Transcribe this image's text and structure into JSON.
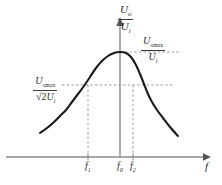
{
  "figure": {
    "kind": "resonance-bandwidth-curve",
    "background_color": "#ffffff",
    "curve_color": "#1a1a1a",
    "axis_color": "#8a8a8a",
    "dash_color": "#9a9a9a",
    "text_color": "#2b2b2b"
  },
  "axes": {
    "y_axis_label": {
      "numerator_symbol": "U",
      "numerator_sub": "o",
      "denominator_symbol": "U",
      "denominator_sub": "i",
      "text": "Uo/Ui"
    },
    "x_axis_label": "f",
    "x_ticks": [
      {
        "id": "f1",
        "symbol": "f",
        "sub": "1",
        "text": "f1",
        "x": 88
      },
      {
        "id": "f0",
        "symbol": "f",
        "sub": "0",
        "text": "f0",
        "x": 120
      },
      {
        "id": "f2",
        "symbol": "f",
        "sub": "2",
        "text": "f2",
        "x": 133
      }
    ]
  },
  "annotations": {
    "peak_level": {
      "numerator_symbol": "U",
      "numerator_sub": "omax",
      "denominator_symbol": "U",
      "denominator_sub": "i",
      "text": "Uomax/Ui"
    },
    "half_power_level": {
      "numerator_symbol": "U",
      "numerator_sub": "omax",
      "denominator_radical": "2",
      "denominator_symbol": "U",
      "denominator_sub": "i",
      "text": "Uomax/(sqrt2 Ui)"
    }
  },
  "chart_data": {
    "type": "line",
    "title": "",
    "xlabel": "f",
    "ylabel": "Uo/Ui",
    "grid": false,
    "legend": null,
    "xlim": [
      30,
      200
    ],
    "ylim": [
      0,
      1.05
    ],
    "markers": {
      "f0_x": 120,
      "f1_x": 88,
      "f2_x": 133,
      "peak_y_px": 52,
      "half_power_y_px": 85,
      "baseline_y_px": 157
    },
    "dashed_guides": [
      {
        "name": "peak-horizontal",
        "x1": 120,
        "y1": 52,
        "x2": 178,
        "y2": 52
      },
      {
        "name": "half-power-horizontal",
        "x1": 62,
        "y1": 85,
        "x2": 172,
        "y2": 85
      },
      {
        "name": "f1-vertical",
        "x1": 88,
        "y1": 85,
        "x2": 88,
        "y2": 157
      },
      {
        "name": "f2-vertical",
        "x1": 133,
        "y1": 85,
        "x2": 133,
        "y2": 157
      }
    ],
    "series": [
      {
        "name": "frequency-response",
        "points_px": [
          [
            40,
            133
          ],
          [
            47,
            128
          ],
          [
            54,
            122
          ],
          [
            60,
            116
          ],
          [
            66,
            110
          ],
          [
            72,
            102
          ],
          [
            78,
            94
          ],
          [
            84,
            86
          ],
          [
            90,
            77
          ],
          [
            96,
            68
          ],
          [
            102,
            61
          ],
          [
            108,
            56
          ],
          [
            114,
            53
          ],
          [
            120,
            52
          ],
          [
            126,
            53
          ],
          [
            131,
            57
          ],
          [
            136,
            65
          ],
          [
            140,
            74
          ],
          [
            144,
            84
          ],
          [
            148,
            94
          ],
          [
            152,
            102
          ],
          [
            157,
            110
          ],
          [
            163,
            118
          ],
          [
            170,
            127
          ],
          [
            178,
            136
          ]
        ]
      }
    ]
  }
}
